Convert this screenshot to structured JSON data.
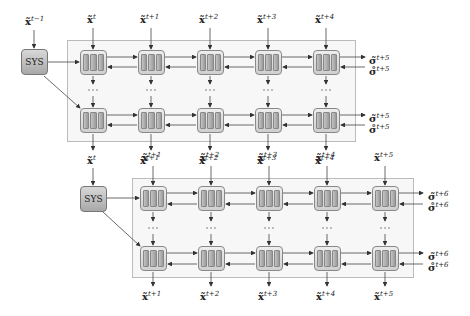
{
  "diagram": {
    "type": "stacked-recurrent-cell-grid",
    "colors": {
      "panel_bg": "#f7f7f7",
      "panel_border": "#bbbbbb",
      "cell_fill": "#d8d8d8",
      "arrow": "#333333"
    },
    "block_1": {
      "sys_label": "SYS",
      "sys_input": {
        "sym": "x̃",
        "sup": "t−1"
      },
      "inputs": [
        {
          "sym": "x̃",
          "sup": "t"
        },
        {
          "sym": "x̃",
          "sup": "t+1"
        },
        {
          "sym": "x̃",
          "sup": "t+2"
        },
        {
          "sym": "x̃",
          "sup": "t+3"
        },
        {
          "sym": "x̃",
          "sup": "t+4"
        }
      ],
      "outputs": [
        {
          "sym": "x̃",
          "sup": "t"
        },
        {
          "sym": "x̃",
          "sup": "t+1"
        },
        {
          "sym": "x̃",
          "sup": "t+2"
        },
        {
          "sym": "x̃",
          "sup": "t+3"
        },
        {
          "sym": "x̃",
          "sup": "t+4"
        }
      ],
      "right_top": [
        {
          "sym": "σ̃",
          "sup": "t+5"
        },
        {
          "sym": "σ̊",
          "sup": "t+5"
        }
      ],
      "right_bottom": [
        {
          "sym": "σ̃",
          "sup": "t+5"
        },
        {
          "sym": "σ̊",
          "sup": "t+5"
        }
      ],
      "ellipsis": "···"
    },
    "block_2": {
      "sys_label": "SYS",
      "sys_input": {
        "sym": "x̃",
        "sup": "t"
      },
      "inputs": [
        {
          "sym": "x̃",
          "sup": "t+1"
        },
        {
          "sym": "x̃",
          "sup": "t+2"
        },
        {
          "sym": "x̃",
          "sup": "t+3"
        },
        {
          "sym": "x̃",
          "sup": "t+4"
        },
        {
          "sym": "x̃",
          "sup": "t+5"
        }
      ],
      "outputs": [
        {
          "sym": "x̃",
          "sup": "t+1"
        },
        {
          "sym": "x̃",
          "sup": "t+2"
        },
        {
          "sym": "x̃",
          "sup": "t+3"
        },
        {
          "sym": "x̃",
          "sup": "t+4"
        },
        {
          "sym": "x̃",
          "sup": "t+5"
        }
      ],
      "right_top": [
        {
          "sym": "σ̃",
          "sup": "t+6"
        },
        {
          "sym": "σ̊",
          "sup": "t+6"
        }
      ],
      "right_bottom": [
        {
          "sym": "σ̃",
          "sup": "t+6"
        },
        {
          "sym": "σ̊",
          "sup": "t+6"
        }
      ],
      "ellipsis": "···"
    }
  }
}
